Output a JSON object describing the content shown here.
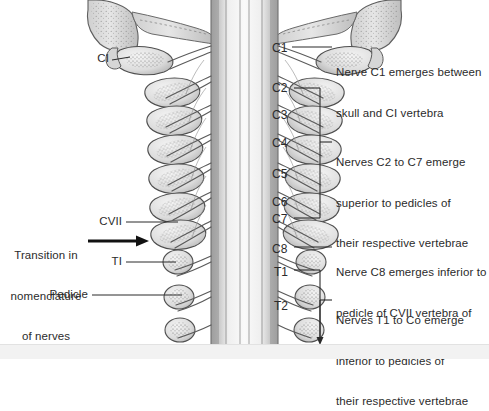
{
  "figure": {
    "background_color": "#ffffff",
    "ink_color": "#2b2b2b",
    "bone_fill": "#dcdcdc",
    "bone_shade": "#b4b4b4",
    "cord_fill": "#e8e8e8"
  },
  "vertebra_labels": [
    {
      "id": "c1",
      "text": "C1",
      "x": 272,
      "y": 42
    },
    {
      "id": "c2",
      "text": "C2",
      "x": 272,
      "y": 82
    },
    {
      "id": "c3",
      "text": "C3",
      "x": 272,
      "y": 109
    },
    {
      "id": "c4",
      "text": "C4",
      "x": 272,
      "y": 137
    },
    {
      "id": "c5",
      "text": "C5",
      "x": 272,
      "y": 168
    },
    {
      "id": "c6",
      "text": "C6",
      "x": 272,
      "y": 196
    },
    {
      "id": "c7",
      "text": "C7",
      "x": 272,
      "y": 213
    },
    {
      "id": "c8",
      "text": "C8",
      "x": 272,
      "y": 243
    },
    {
      "id": "t1",
      "text": "T1",
      "x": 274,
      "y": 266
    },
    {
      "id": "t2",
      "text": "T2",
      "x": 274,
      "y": 300
    }
  ],
  "left_labels": [
    {
      "id": "ci",
      "text": "CI",
      "x": 97,
      "y": 55
    },
    {
      "id": "cvii",
      "text": "CVII",
      "x": 100,
      "y": 216
    },
    {
      "id": "ti",
      "text": "TI",
      "x": 111,
      "y": 256
    },
    {
      "id": "pedicle",
      "text": "Pedicle",
      "x": 47,
      "y": 288
    }
  ],
  "transition_note": {
    "line1": "Transition in",
    "line2": "nomenclature",
    "line3": "of nerves",
    "x": 10,
    "y": 222
  },
  "annotations": [
    {
      "id": "nerve-c1",
      "lines": [
        "Nerve C1 emerges between",
        "skull and CI vertebra"
      ],
      "x": 336,
      "y": 38
    },
    {
      "id": "nerves-c2-c7",
      "lines": [
        "Nerves C2 to C7 emerge",
        "superior to pedicles of",
        "their respective vertebrae"
      ],
      "x": 336,
      "y": 128
    },
    {
      "id": "nerve-c8",
      "lines": [
        "Nerve C8 emerges inferior to",
        "pedicle of CVII vertebra of",
        "their respective vertebrae"
      ],
      "x": 336,
      "y": 238
    },
    {
      "id": "nerves-t1-co",
      "lines": [
        "Nerves T1 to Co emerge",
        "inferior to pedicles of",
        "their respective vertebrae"
      ],
      "x": 336,
      "y": 286
    }
  ]
}
